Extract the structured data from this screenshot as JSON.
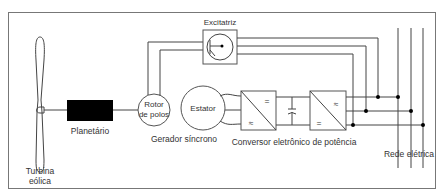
{
  "diagram": {
    "title": "",
    "components": {
      "turbine": {
        "label_line1": "Turbina",
        "label_line2": "eólica"
      },
      "gearbox": {
        "label": "Planetário"
      },
      "rotor": {
        "label_line1": "Rotor",
        "label_line2": "de polos"
      },
      "stator": {
        "label": "Estator"
      },
      "generator": {
        "label": "Gerador síncrono"
      },
      "exciter": {
        "label": "Excitatriz"
      },
      "converter": {
        "label": "Conversor eletrônico de potência",
        "rectifier": {
          "ac_symbol": "≈",
          "dc_symbol": "="
        },
        "inverter": {
          "ac_symbol": "≈",
          "dc_symbol": "="
        }
      },
      "grid": {
        "label": "Rede elétrica"
      }
    },
    "colors": {
      "line": "#444444",
      "fill_gearbox": "#000000",
      "background": "#ffffff"
    }
  }
}
